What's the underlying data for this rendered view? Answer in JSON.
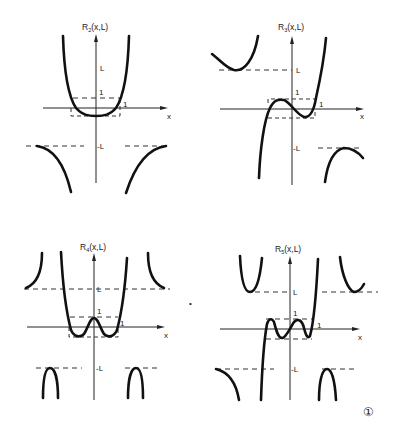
{
  "figure": {
    "figure_number_glyph": "①",
    "stray_mark": "•",
    "panels": [
      {
        "id": "r2",
        "title_base": "R",
        "title_sub": "2",
        "title_args": "(x,L)",
        "x_label": "x",
        "l_label": "L",
        "neg_l_label": "-L",
        "one_y_label": "1",
        "one_x_label": "1"
      },
      {
        "id": "r3",
        "title_base": "R",
        "title_sub": "3",
        "title_args": "(x,L)",
        "x_label": "x",
        "l_label": "L",
        "neg_l_label": "-L",
        "one_y_label": "1",
        "one_x_label": "1"
      },
      {
        "id": "r4",
        "title_base": "R",
        "title_sub": "4",
        "title_args": "(x,L)",
        "x_label": "x",
        "l_label": "L",
        "neg_l_label": "-L",
        "one_y_label": "1",
        "one_x_label": "1"
      },
      {
        "id": "r5",
        "title_base": "R",
        "title_sub": "5",
        "title_args": "(x,L)",
        "x_label": "x",
        "l_label": "L",
        "neg_l_label": "-L",
        "one_y_label": "1",
        "one_x_label": "1"
      }
    ]
  }
}
